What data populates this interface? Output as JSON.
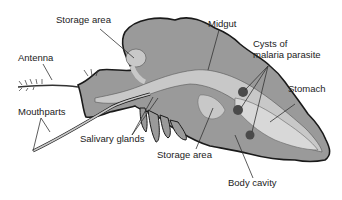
{
  "diagram": {
    "colors": {
      "body": "#9a9a9a",
      "outline": "#1a1a1a",
      "gut": "#c8c8c8",
      "stomach": "#d8d8d8",
      "cyst": "#4a4a4a"
    },
    "labels": {
      "storage_area_top": "Storage area",
      "antenna": "Antenna",
      "midgut": "Midgut",
      "cysts_line1": "Cysts of",
      "cysts_line2": "malaria parasite",
      "stomach": "Stomach",
      "mouthparts": "Mouthparts",
      "salivary_glands": "Salivary glands",
      "storage_area_bottom": "Storage area",
      "body_cavity": "Body cavity"
    }
  }
}
